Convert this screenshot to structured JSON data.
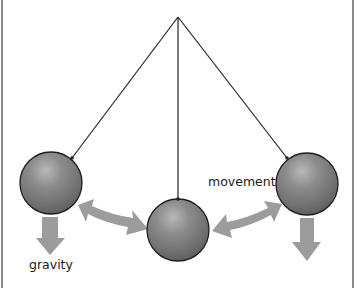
{
  "diagram": {
    "labels": {
      "gravity": "gravity",
      "movement": "movement"
    },
    "colors": {
      "frame": "#8a8a8a",
      "string": "#222222",
      "ball_base": "#7a7a7a",
      "ball_highlight": "#b0b0b0",
      "ball_shadow": "#555555",
      "arrow": "#9a9a9a"
    },
    "pivot": {
      "x": 178,
      "y": 17
    },
    "balls": [
      {
        "name": "left",
        "cx": 51,
        "cy": 183,
        "r": 31,
        "attach": {
          "x": 72,
          "y": 158
        }
      },
      {
        "name": "center",
        "cx": 178,
        "cy": 230,
        "r": 31,
        "attach": {
          "x": 178,
          "y": 199
        }
      },
      {
        "name": "right",
        "cx": 307,
        "cy": 184,
        "r": 31,
        "attach": {
          "x": 287,
          "y": 158
        }
      }
    ],
    "arrows": [
      {
        "type": "down",
        "name": "gravity-left"
      },
      {
        "type": "double",
        "name": "movement-left"
      },
      {
        "type": "double",
        "name": "movement-right"
      },
      {
        "type": "down",
        "name": "gravity-right"
      }
    ]
  }
}
